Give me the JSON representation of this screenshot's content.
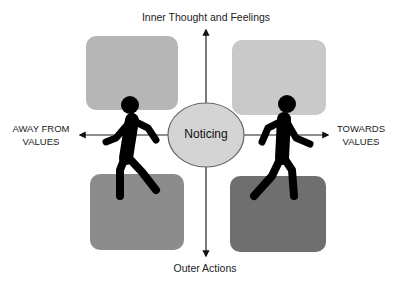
{
  "diagram": {
    "axes": {
      "top_label": "Inner Thought and Feelings",
      "bottom_label": "Outer Actions",
      "left_label_line1": "AWAY FROM",
      "left_label_line2": "VALUES",
      "right_label_line1": "TOWARDS",
      "right_label_line2": "VALUES"
    },
    "center": {
      "label": "Noticing",
      "fill": "#d4d4d4",
      "stroke": "#666666"
    },
    "quadrants": [
      {
        "name": "top-left",
        "fill": "#b6b6b6"
      },
      {
        "name": "top-right",
        "fill": "#c9c9c9"
      },
      {
        "name": "bottom-left",
        "fill": "#8c8c8c"
      },
      {
        "name": "bottom-right",
        "fill": "#6f6f6f"
      }
    ],
    "figures": [
      {
        "name": "walking-person-left",
        "color": "#000000"
      },
      {
        "name": "walking-person-right",
        "color": "#000000"
      }
    ]
  }
}
